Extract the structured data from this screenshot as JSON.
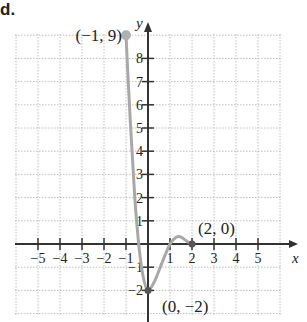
{
  "problem": {
    "label": "d."
  },
  "chart_data": {
    "type": "line",
    "title": "",
    "xlabel": "x",
    "ylabel": "y",
    "xlim": [
      -6,
      5.5
    ],
    "ylim": [
      -3,
      9
    ],
    "grid": true,
    "x_ticks": [
      -5,
      -4,
      -3,
      -2,
      -1,
      1,
      2,
      3,
      4,
      5
    ],
    "x_tick_labels": [
      "−5",
      "−4",
      "−3",
      "−2",
      "−1",
      "1",
      "2",
      "3",
      "4",
      "5"
    ],
    "y_ticks": [
      -2,
      -1,
      1,
      2,
      3,
      4,
      5,
      6,
      7,
      8
    ],
    "y_tick_labels": [
      "−2",
      "−1",
      "1",
      "2",
      "3",
      "4",
      "5",
      "6",
      "7",
      "8"
    ],
    "series": [
      {
        "name": "curve",
        "color": "#a8a8a8",
        "x": [
          -1,
          -0.8,
          -0.6,
          -0.4,
          -0.2,
          0,
          0.3,
          0.6,
          1,
          1.3,
          1.5,
          1.8,
          2
        ],
        "y": [
          9,
          5.2,
          2.0,
          -0.2,
          -1.5,
          -2,
          -1.6,
          -0.9,
          0,
          0.3,
          0.3,
          0.1,
          0
        ]
      }
    ],
    "points": [
      {
        "x": -1,
        "y": 9,
        "label": "(−1, 9)",
        "filled": true
      },
      {
        "x": 0,
        "y": -2,
        "label": "(0, −2)",
        "filled": true
      },
      {
        "x": 2,
        "y": 0,
        "label": "(2, 0)",
        "filled": true
      }
    ]
  },
  "colors": {
    "axis": "#333333",
    "grid": "#b0b0b0",
    "curve": "#a8a8a8",
    "text": "#222222"
  }
}
